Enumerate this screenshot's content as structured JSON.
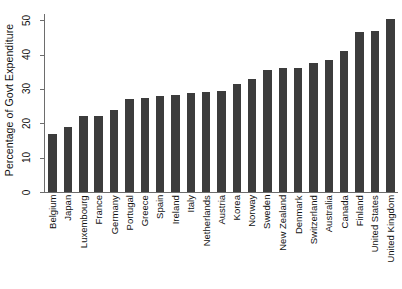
{
  "chart_data": {
    "type": "bar",
    "title": "",
    "xlabel": "",
    "ylabel": "Percentage of Govt Expenditure",
    "ylim": [
      0,
      53
    ],
    "yticks": [
      0,
      10,
      20,
      30,
      40,
      50
    ],
    "grid": false,
    "legend": null,
    "orientation": "vertical",
    "bar_color": "#3c3c3c",
    "categories": [
      "Belgium",
      "Japan",
      "Luxembourg",
      "France",
      "Germany",
      "Portugal",
      "Greece",
      "Spain",
      "Ireland",
      "Italy",
      "Netherlands",
      "Austria",
      "Korea",
      "Norway",
      "Sweden",
      "New Zealand",
      "Denmark",
      "Switzerland",
      "Australia",
      "Canada",
      "Finland",
      "United States",
      "United Kingdom"
    ],
    "values": [
      17.0,
      19.0,
      22.0,
      22.0,
      23.8,
      27.0,
      27.5,
      28.0,
      28.2,
      28.7,
      29.0,
      29.3,
      31.5,
      33.0,
      35.5,
      36.0,
      36.2,
      37.5,
      38.5,
      41.0,
      46.5,
      47.0,
      50.5
    ]
  },
  "axes": {
    "y_title": "Percentage of Govt Expenditure",
    "y_tick_labels": [
      "0",
      "10",
      "20",
      "30",
      "40",
      "50"
    ]
  }
}
